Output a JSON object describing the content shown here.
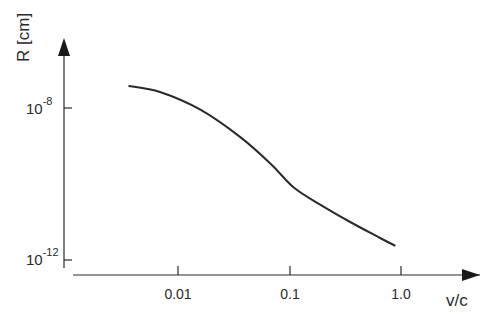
{
  "chart_data": {
    "type": "line",
    "title": "",
    "xlabel": "v/c",
    "ylabel": "R [cm]",
    "x_scale": "log",
    "y_scale": "log",
    "x_ticks": [
      "0.01",
      "0.1",
      "1.0"
    ],
    "x_tick_values": [
      0.01,
      0.1,
      1.0
    ],
    "y_ticks": [
      {
        "base": "10",
        "exp": "-8",
        "value": 1e-08
      },
      {
        "base": "10",
        "exp": "-12",
        "value": 1e-12
      }
    ],
    "grid": false,
    "legend": null,
    "series": [
      {
        "name": "R(v/c)",
        "x": [
          0.0036,
          0.0069,
          0.016,
          0.036,
          0.068,
          0.11,
          0.19,
          0.35,
          0.65,
          0.89
        ],
        "log10_y": [
          -7.42,
          -7.58,
          -8.05,
          -8.76,
          -9.47,
          -10.1,
          -10.55,
          -11.0,
          -11.42,
          -11.63
        ]
      }
    ],
    "xlim": [
      0.001,
      3.0
    ],
    "ylim_log10": [
      -12.4,
      -6.2
    ]
  },
  "axes": {
    "ylabel": "R [cm]",
    "xlabel": "v/c",
    "yticks": [
      {
        "base": "10",
        "exp": "-8"
      },
      {
        "base": "10",
        "exp": "-12"
      }
    ],
    "xticks": [
      "0.01",
      "0.1",
      "1.0"
    ]
  },
  "style": {
    "line_color": "#2a2a2a",
    "axis_color": "#2a2a2a"
  }
}
